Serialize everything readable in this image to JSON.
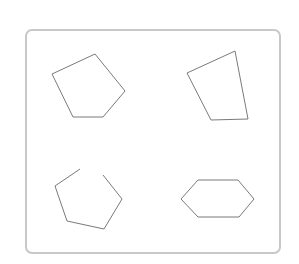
{
  "canvas": {
    "width": 299,
    "height": 264,
    "background": "#ffffff"
  },
  "frame": {
    "x": 26,
    "y": 30,
    "width": 254,
    "height": 223,
    "rx": 6,
    "stroke": "#c8c8c8"
  },
  "stroke_color": "#7a7a7a",
  "shapes": [
    {
      "id": "pentagon",
      "type": "closed",
      "points": "95,54 125,91 103,117 73,117 52,74"
    },
    {
      "id": "quadrilateral",
      "type": "closed",
      "points": "235,51 248,119 211,120 187,73"
    },
    {
      "id": "open-pentagon",
      "type": "open",
      "points": "80,169 55,186 67,221 104,229 122,199 103,175"
    },
    {
      "id": "hexagon",
      "type": "closed",
      "points": "198,180 238,180 254,199 239,217 198,217 181,199"
    }
  ]
}
